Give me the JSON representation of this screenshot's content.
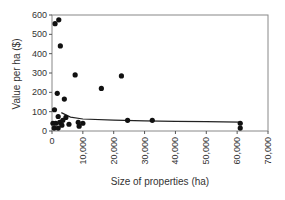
{
  "chart_data": {
    "type": "scatter",
    "title": "",
    "xlabel": "Size of properties (ha)",
    "ylabel": "Value per ha ($)",
    "xlim": [
      0,
      70000
    ],
    "ylim": [
      0,
      600
    ],
    "x_ticks": [
      "0",
      "10,000",
      "20,000",
      "30,000",
      "40,000",
      "50,000",
      "60,000",
      "70,000"
    ],
    "y_ticks": [
      "0",
      "100",
      "200",
      "300",
      "400",
      "500",
      "600"
    ],
    "grid": false,
    "series": [
      {
        "name": "Properties",
        "points": [
          {
            "x": 1000,
            "y": 555
          },
          {
            "x": 2200,
            "y": 575
          },
          {
            "x": 2700,
            "y": 440
          },
          {
            "x": 7500,
            "y": 290
          },
          {
            "x": 16000,
            "y": 220
          },
          {
            "x": 22500,
            "y": 285
          },
          {
            "x": 1700,
            "y": 195
          },
          {
            "x": 4000,
            "y": 165
          },
          {
            "x": 800,
            "y": 110
          },
          {
            "x": 2000,
            "y": 75
          },
          {
            "x": 4500,
            "y": 70
          },
          {
            "x": 300,
            "y": 40
          },
          {
            "x": 1200,
            "y": 40
          },
          {
            "x": 2500,
            "y": 45
          },
          {
            "x": 3500,
            "y": 55
          },
          {
            "x": 5500,
            "y": 35
          },
          {
            "x": 8500,
            "y": 45
          },
          {
            "x": 10000,
            "y": 40
          },
          {
            "x": 700,
            "y": 15
          },
          {
            "x": 2000,
            "y": 15
          },
          {
            "x": 3200,
            "y": 30
          },
          {
            "x": 8800,
            "y": 25
          },
          {
            "x": 24500,
            "y": 55
          },
          {
            "x": 32500,
            "y": 55
          },
          {
            "x": 61000,
            "y": 40
          },
          {
            "x": 61000,
            "y": 15
          }
        ]
      }
    ],
    "trend_line": {
      "name": "Fitted curve",
      "points": [
        {
          "x": 3000,
          "y": 95
        },
        {
          "x": 6000,
          "y": 72
        },
        {
          "x": 10000,
          "y": 62
        },
        {
          "x": 20000,
          "y": 56
        },
        {
          "x": 30000,
          "y": 52
        },
        {
          "x": 40000,
          "y": 50
        },
        {
          "x": 50000,
          "y": 48
        },
        {
          "x": 61000,
          "y": 46
        }
      ]
    }
  }
}
